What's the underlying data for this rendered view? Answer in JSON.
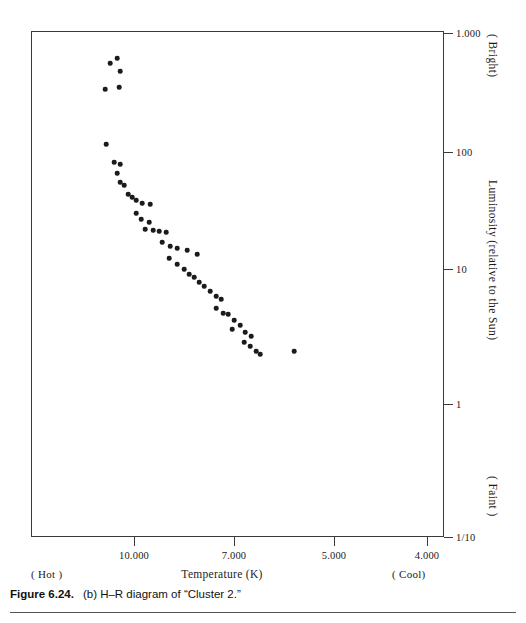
{
  "figure": {
    "number": "Figure 6.24.",
    "caption": "(b) H–R diagram of “Cluster 2.”"
  },
  "axes": {
    "x": {
      "title": "Temperature (K)",
      "left_annotation": "( Hot )",
      "right_annotation": "( Cool)",
      "ticks": [
        {
          "label": "10.000",
          "px": 134
        },
        {
          "label": "7.000",
          "px": 234
        },
        {
          "label": "5.000",
          "px": 334
        },
        {
          "label": "4.000",
          "px": 427
        }
      ]
    },
    "y": {
      "title": "Luminosity (relative to the Sun)",
      "top_annotation": "( Bright)",
      "bottom_annotation": "( Faint )",
      "ticks": [
        {
          "label": "1.000",
          "px": 33
        },
        {
          "label": "100",
          "px": 152
        },
        {
          "label": "10",
          "px": 269
        },
        {
          "label": "1",
          "px": 404
        },
        {
          "label": "1/10",
          "px": 537
        }
      ]
    }
  },
  "chart_data": {
    "type": "scatter",
    "title": "(b) H–R diagram of “Cluster 2.”",
    "xlabel": "Temperature (K)",
    "ylabel": "Luminosity (relative to the Sun)",
    "x_scale": "log-reversed",
    "y_scale": "log",
    "xlim": [
      11500,
      3700
    ],
    "ylim": [
      0.1,
      1000
    ],
    "grid": false,
    "legend": null,
    "x_ticks": [
      10000,
      7000,
      5000,
      4000
    ],
    "y_ticks": [
      1000,
      100,
      10,
      1,
      0.1
    ],
    "point_color": "#1b1b1b",
    "series": [
      {
        "name": "Cluster 2 stars",
        "note": "Temperature in K, Luminosity relative to the Sun",
        "points": [
          [
            10900,
            480
          ],
          [
            10600,
            560
          ],
          [
            10450,
            400
          ],
          [
            11100,
            250
          ],
          [
            10500,
            265
          ],
          [
            11050,
            125
          ],
          [
            10800,
            88
          ],
          [
            10500,
            84
          ],
          [
            10650,
            66
          ],
          [
            10500,
            50
          ],
          [
            10350,
            46
          ],
          [
            10200,
            36
          ],
          [
            10050,
            33
          ],
          [
            9900,
            30
          ],
          [
            9700,
            28
          ],
          [
            9450,
            27
          ],
          [
            9900,
            22
          ],
          [
            9750,
            19
          ],
          [
            9500,
            17.5
          ],
          [
            9600,
            15
          ],
          [
            9350,
            14.5
          ],
          [
            9150,
            14
          ],
          [
            8950,
            13.5
          ],
          [
            9050,
            11
          ],
          [
            8800,
            10
          ],
          [
            8600,
            9.5
          ],
          [
            8300,
            9.2
          ],
          [
            8000,
            8.6
          ],
          [
            9000,
            8.0
          ],
          [
            8800,
            7.2
          ],
          [
            8600,
            6.6
          ],
          [
            8450,
            6.0
          ],
          [
            8300,
            5.6
          ],
          [
            8150,
            5.1
          ],
          [
            8000,
            4.7
          ],
          [
            7850,
            4.2
          ],
          [
            7700,
            3.8
          ],
          [
            7550,
            3.5
          ],
          [
            7700,
            2.9
          ],
          [
            7500,
            2.6
          ],
          [
            7350,
            2.5
          ],
          [
            7200,
            2.2
          ],
          [
            7050,
            1.95
          ],
          [
            7300,
            1.8
          ],
          [
            6950,
            1.55
          ],
          [
            6800,
            1.4
          ],
          [
            7000,
            1.25
          ],
          [
            6850,
            1.15
          ],
          [
            6700,
            1.05
          ],
          [
            6600,
            0.98
          ],
          [
            5650,
            1.02
          ]
        ],
        "pixel_points": [
          [
            109,
            62
          ],
          [
            116,
            57
          ],
          [
            119,
            70
          ],
          [
            104,
            88
          ],
          [
            118,
            86
          ],
          [
            105,
            143
          ],
          [
            113,
            161
          ],
          [
            119,
            163
          ],
          [
            116,
            172
          ],
          [
            119,
            181
          ],
          [
            123,
            184
          ],
          [
            127,
            193
          ],
          [
            131,
            196
          ],
          [
            135,
            199
          ],
          [
            141,
            202
          ],
          [
            149,
            203
          ],
          [
            135,
            212
          ],
          [
            140,
            218
          ],
          [
            148,
            221
          ],
          [
            144,
            228
          ],
          [
            152,
            229
          ],
          [
            158,
            230
          ],
          [
            165,
            231
          ],
          [
            161,
            241
          ],
          [
            169,
            245
          ],
          [
            176,
            247
          ],
          [
            186,
            249
          ],
          [
            196,
            253
          ],
          [
            168,
            257
          ],
          [
            176,
            263
          ],
          [
            183,
            268
          ],
          [
            188,
            273
          ],
          [
            193,
            276
          ],
          [
            198,
            281
          ],
          [
            203,
            285
          ],
          [
            209,
            290
          ],
          [
            215,
            295
          ],
          [
            220,
            298
          ],
          [
            215,
            307
          ],
          [
            222,
            312
          ],
          [
            227,
            313
          ],
          [
            233,
            319
          ],
          [
            239,
            324
          ],
          [
            231,
            328
          ],
          [
            244,
            331
          ],
          [
            250,
            335
          ],
          [
            243,
            341
          ],
          [
            249,
            345
          ],
          [
            255,
            350
          ],
          [
            259,
            353
          ],
          [
            293,
            350
          ]
        ]
      }
    ]
  }
}
